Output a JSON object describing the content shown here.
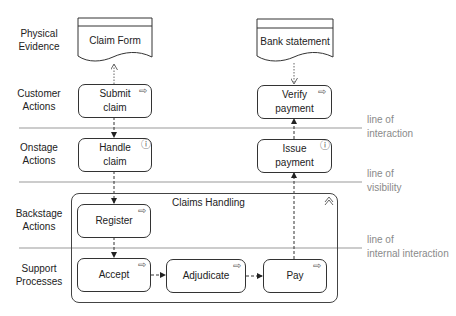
{
  "lanes": [
    {
      "id": "physical-evidence",
      "label": "Physical Evidence"
    },
    {
      "id": "customer-actions",
      "label": "Customer Actions"
    },
    {
      "id": "onstage-actions",
      "label": "Onstage Actions"
    },
    {
      "id": "backstage-actions",
      "label": "Backstage Actions"
    },
    {
      "id": "support-processes",
      "label": "Support Processes"
    }
  ],
  "lines": [
    {
      "id": "line-of-interaction",
      "label_1": "line of",
      "label_2": "interaction"
    },
    {
      "id": "line-of-visibility",
      "label_1": "line of",
      "label_2": "visibility"
    },
    {
      "id": "line-of-internal-interaction",
      "label_1": "line of",
      "label_2": "internal interaction"
    }
  ],
  "documents": [
    {
      "id": "claim-form",
      "label": "Claim Form"
    },
    {
      "id": "bank-statement",
      "label": "Bank statement"
    }
  ],
  "nodes": {
    "submit_claim": {
      "label": "Submit claim",
      "icon": "process-arrow-icon"
    },
    "verify_payment": {
      "label": "Verify payment",
      "icon": "process-arrow-icon"
    },
    "handle_claim": {
      "label": "Handle claim",
      "icon": "interaction-icon"
    },
    "issue_payment": {
      "label": "Issue payment",
      "icon": "interaction-icon"
    },
    "register": {
      "label": "Register",
      "icon": "process-arrow-icon"
    },
    "accept": {
      "label": "Accept",
      "icon": "process-arrow-icon"
    },
    "adjudicate": {
      "label": "Adjudicate",
      "icon": "process-arrow-icon"
    },
    "pay": {
      "label": "Pay",
      "icon": "process-arrow-icon"
    }
  },
  "group": {
    "title": "Claims Handling",
    "icon": "collapse-chevron-icon"
  },
  "glyphs": {
    "arrow": "⇨",
    "interaction": "ⓘ",
    "chevron": "︿"
  },
  "colors": {
    "stroke": "#333333",
    "divider": "#999999",
    "line_label": "#8a8a8a"
  }
}
